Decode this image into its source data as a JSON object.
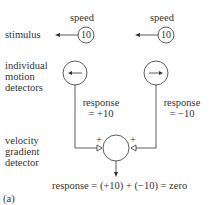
{
  "labels": {
    "speed_left": "speed",
    "speed_right": "speed",
    "stimulus": "stimulus",
    "detectors_line1": "individual",
    "detectors_line2": "motion",
    "detectors_line3": "detectors",
    "gradient_line1": "velocity",
    "gradient_line2": "gradient",
    "gradient_line3": "detector",
    "panel": "(a)"
  },
  "stimuli": [
    {
      "value": "10",
      "direction": "left"
    },
    {
      "value": "10",
      "direction": "left"
    }
  ],
  "detectors": [
    {
      "preferred_direction": "left",
      "response_line1": "response",
      "response_line2": "= +10"
    },
    {
      "preferred_direction": "right",
      "response_line1": "response",
      "response_line2": "= −10"
    }
  ],
  "synapses": {
    "left_sign": "+",
    "right_sign": "+"
  },
  "output": {
    "text": "response = (+10) + (−10) = zero"
  },
  "colors": {
    "stroke": "#333333",
    "text": "#333333",
    "background": "#ffffff"
  }
}
